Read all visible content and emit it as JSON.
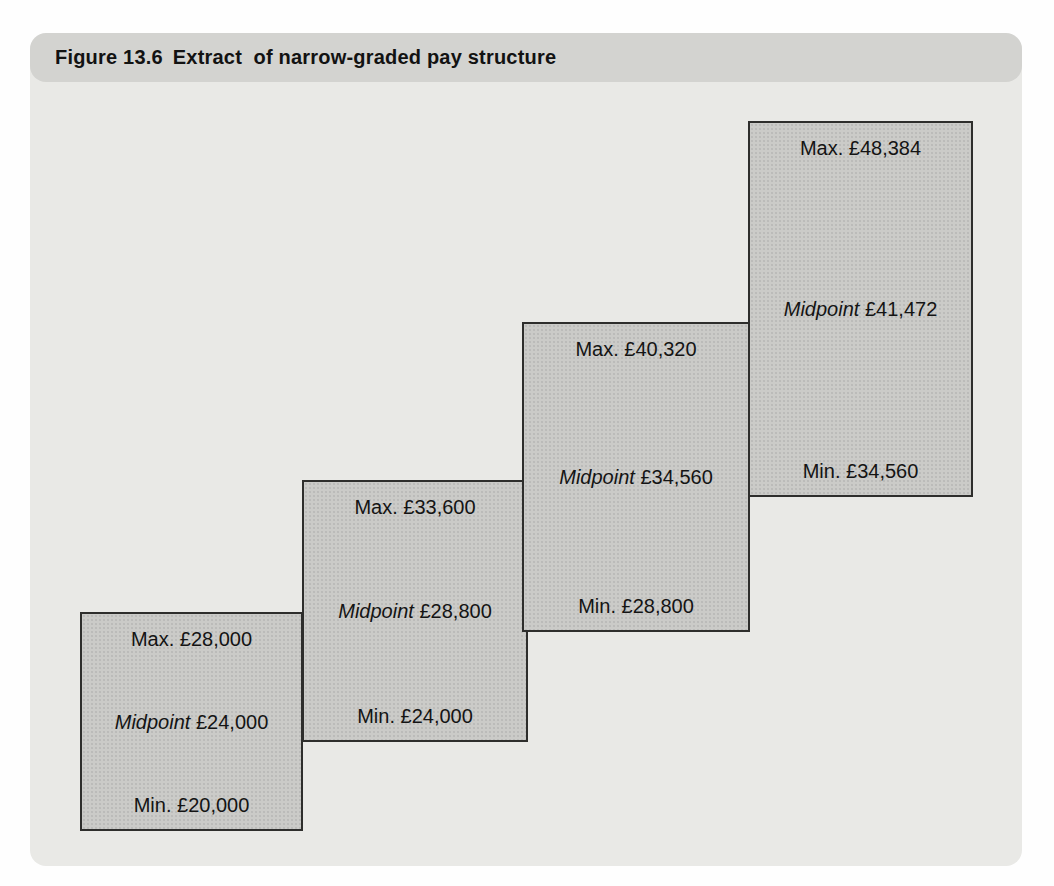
{
  "figure": {
    "label": "Figure 13.6",
    "title": "Extract  of narrow-graded pay structure"
  },
  "grades": [
    {
      "max_label": "Max. £28,000",
      "midpoint_word": "Midpoint",
      "midpoint_value": "£24,000",
      "min_label": "Min. £20,000"
    },
    {
      "max_label": "Max. £33,600",
      "midpoint_word": "Midpoint",
      "midpoint_value": "£28,800",
      "min_label": "Min. £24,000"
    },
    {
      "max_label": "Max. £40,320",
      "midpoint_word": "Midpoint",
      "midpoint_value": "£34,560",
      "min_label": "Min. £28,800"
    },
    {
      "max_label": "Max. £48,384",
      "midpoint_word": "Midpoint",
      "midpoint_value": "£41,472",
      "min_label": "Min. £34,560"
    }
  ],
  "chart_data": {
    "type": "table",
    "title": "Extract of narrow-graded pay structure",
    "currency_symbol": "£",
    "grades": [
      {
        "min": 20000,
        "midpoint": 24000,
        "max": 28000
      },
      {
        "min": 24000,
        "midpoint": 28800,
        "max": 33600
      },
      {
        "min": 28800,
        "midpoint": 34560,
        "max": 40320
      },
      {
        "min": 34560,
        "midpoint": 41472,
        "max": 48384
      }
    ]
  },
  "colors": {
    "page_background": "#fefefe",
    "panel_body": "#e9e9e6",
    "title_bar": "#d3d3d0",
    "box_fill": "#cbcbc8",
    "box_border": "#2e2e2c",
    "text": "#141414"
  }
}
